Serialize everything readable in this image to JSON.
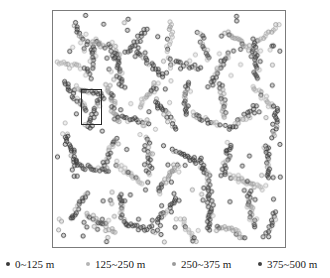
{
  "figure": {
    "type": "scatter-map",
    "background_color": "#ffffff",
    "frame": {
      "border_color": "#7b7b7b",
      "x": 52,
      "y": 10,
      "width": 234,
      "height": 238
    },
    "highlight_rect": {
      "name": "inset-selection-box",
      "border_color": "#2a2a2a",
      "x": 28,
      "y": 78,
      "width": 21,
      "height": 36
    }
  },
  "legend": {
    "items": [
      {
        "label": "0~125 m",
        "color": "#3a3a3a",
        "x": 6
      },
      {
        "label": "125~250 m",
        "color": "#b4b4b4",
        "x": 86
      },
      {
        "label": "250~375 m",
        "color": "#9a9a9a",
        "x": 172
      },
      {
        "label": "375~500 m",
        "color": "#404040",
        "x": 258
      }
    ]
  },
  "chart_data": {
    "type": "scatter",
    "title": "",
    "xlabel": "",
    "ylabel": "",
    "grid": false,
    "axis_ticks": false,
    "legend_position": "bottom",
    "xlim": [
      0,
      234
    ],
    "ylim": [
      0,
      238
    ],
    "categories": [
      "0~125 m",
      "125~250 m",
      "250~375 m",
      "375~500 m"
    ],
    "category_colors": [
      "#3a3a3a",
      "#b4b4b4",
      "#9a9a9a",
      "#404040"
    ],
    "marker_radius": 2.1,
    "marker_style": "open-circle",
    "clusters": [
      {
        "cx": 28,
        "cy": 28,
        "angle": 62,
        "len": 34,
        "spread": 4.0,
        "n": 16,
        "cat": 0
      },
      {
        "cx": 16,
        "cy": 54,
        "angle": 8,
        "len": 24,
        "spread": 3.2,
        "n": 12,
        "cat": 1
      },
      {
        "cx": 40,
        "cy": 48,
        "angle": 104,
        "len": 40,
        "spread": 3.6,
        "n": 20,
        "cat": 0
      },
      {
        "cx": 54,
        "cy": 36,
        "angle": 22,
        "len": 30,
        "spread": 3.0,
        "n": 14,
        "cat": 2
      },
      {
        "cx": 66,
        "cy": 60,
        "angle": 78,
        "len": 36,
        "spread": 3.4,
        "n": 18,
        "cat": 0
      },
      {
        "cx": 84,
        "cy": 30,
        "angle": 130,
        "len": 32,
        "spread": 3.0,
        "n": 15,
        "cat": 3
      },
      {
        "cx": 98,
        "cy": 52,
        "angle": 44,
        "len": 38,
        "spread": 3.6,
        "n": 19,
        "cat": 0
      },
      {
        "cx": 118,
        "cy": 26,
        "angle": 96,
        "len": 30,
        "spread": 3.2,
        "n": 13,
        "cat": 1
      },
      {
        "cx": 132,
        "cy": 54,
        "angle": 16,
        "len": 34,
        "spread": 3.4,
        "n": 17,
        "cat": 0
      },
      {
        "cx": 152,
        "cy": 34,
        "angle": 70,
        "len": 28,
        "spread": 3.0,
        "n": 12,
        "cat": 3
      },
      {
        "cx": 168,
        "cy": 58,
        "angle": 118,
        "len": 36,
        "spread": 3.6,
        "n": 18,
        "cat": 0
      },
      {
        "cx": 186,
        "cy": 30,
        "angle": 34,
        "len": 30,
        "spread": 3.2,
        "n": 14,
        "cat": 2
      },
      {
        "cx": 204,
        "cy": 48,
        "angle": 86,
        "len": 40,
        "spread": 3.8,
        "n": 20,
        "cat": 0
      },
      {
        "cx": 218,
        "cy": 22,
        "angle": 142,
        "len": 26,
        "spread": 2.8,
        "n": 11,
        "cat": 1
      },
      {
        "cx": 22,
        "cy": 86,
        "angle": 52,
        "len": 36,
        "spread": 3.6,
        "n": 18,
        "cat": 0
      },
      {
        "cx": 42,
        "cy": 102,
        "angle": 110,
        "len": 32,
        "spread": 3.2,
        "n": 16,
        "cat": 3
      },
      {
        "cx": 36,
        "cy": 82,
        "angle": 20,
        "len": 28,
        "spread": 3.0,
        "n": 13,
        "cat": 0
      },
      {
        "cx": 60,
        "cy": 92,
        "angle": 74,
        "len": 38,
        "spread": 3.6,
        "n": 19,
        "cat": 2
      },
      {
        "cx": 80,
        "cy": 110,
        "angle": 12,
        "len": 34,
        "spread": 3.4,
        "n": 17,
        "cat": 0
      },
      {
        "cx": 96,
        "cy": 84,
        "angle": 128,
        "len": 30,
        "spread": 3.0,
        "n": 14,
        "cat": 1
      },
      {
        "cx": 114,
        "cy": 104,
        "angle": 58,
        "len": 36,
        "spread": 3.6,
        "n": 18,
        "cat": 0
      },
      {
        "cx": 134,
        "cy": 88,
        "angle": 98,
        "len": 32,
        "spread": 3.2,
        "n": 16,
        "cat": 3
      },
      {
        "cx": 154,
        "cy": 110,
        "angle": 26,
        "len": 30,
        "spread": 3.0,
        "n": 14,
        "cat": 0
      },
      {
        "cx": 172,
        "cy": 90,
        "angle": 80,
        "len": 34,
        "spread": 3.4,
        "n": 17,
        "cat": 2
      },
      {
        "cx": 192,
        "cy": 108,
        "angle": 136,
        "len": 36,
        "spread": 3.6,
        "n": 18,
        "cat": 0
      },
      {
        "cx": 212,
        "cy": 86,
        "angle": 46,
        "len": 28,
        "spread": 3.0,
        "n": 13,
        "cat": 1
      },
      {
        "cx": 224,
        "cy": 112,
        "angle": 92,
        "len": 32,
        "spread": 3.2,
        "n": 15,
        "cat": 0
      },
      {
        "cx": 18,
        "cy": 140,
        "angle": 66,
        "len": 32,
        "spread": 3.2,
        "n": 16,
        "cat": 0
      },
      {
        "cx": 38,
        "cy": 158,
        "angle": 14,
        "len": 36,
        "spread": 3.6,
        "n": 18,
        "cat": 3
      },
      {
        "cx": 58,
        "cy": 142,
        "angle": 112,
        "len": 30,
        "spread": 3.0,
        "n": 14,
        "cat": 0
      },
      {
        "cx": 76,
        "cy": 164,
        "angle": 40,
        "len": 34,
        "spread": 3.4,
        "n": 17,
        "cat": 1
      },
      {
        "cx": 96,
        "cy": 146,
        "angle": 84,
        "len": 38,
        "spread": 3.8,
        "n": 19,
        "cat": 0
      },
      {
        "cx": 116,
        "cy": 168,
        "angle": 124,
        "len": 32,
        "spread": 3.2,
        "n": 16,
        "cat": 2
      },
      {
        "cx": 136,
        "cy": 148,
        "angle": 30,
        "len": 36,
        "spread": 3.6,
        "n": 18,
        "cat": 0
      },
      {
        "cx": 156,
        "cy": 170,
        "angle": 72,
        "len": 30,
        "spread": 3.0,
        "n": 14,
        "cat": 3
      },
      {
        "cx": 176,
        "cy": 150,
        "angle": 104,
        "len": 34,
        "spread": 3.4,
        "n": 17,
        "cat": 0
      },
      {
        "cx": 196,
        "cy": 172,
        "angle": 18,
        "len": 38,
        "spread": 3.8,
        "n": 19,
        "cat": 1
      },
      {
        "cx": 216,
        "cy": 152,
        "angle": 88,
        "len": 32,
        "spread": 3.2,
        "n": 16,
        "cat": 0
      },
      {
        "cx": 26,
        "cy": 196,
        "angle": 120,
        "len": 30,
        "spread": 3.0,
        "n": 14,
        "cat": 0
      },
      {
        "cx": 48,
        "cy": 214,
        "angle": 36,
        "len": 34,
        "spread": 3.4,
        "n": 17,
        "cat": 2
      },
      {
        "cx": 70,
        "cy": 200,
        "angle": 82,
        "len": 30,
        "spread": 3.0,
        "n": 14,
        "cat": 0
      },
      {
        "cx": 92,
        "cy": 218,
        "angle": 10,
        "len": 36,
        "spread": 3.6,
        "n": 18,
        "cat": 3
      },
      {
        "cx": 114,
        "cy": 202,
        "angle": 132,
        "len": 32,
        "spread": 3.2,
        "n": 16,
        "cat": 0
      },
      {
        "cx": 136,
        "cy": 220,
        "angle": 56,
        "len": 30,
        "spread": 3.0,
        "n": 14,
        "cat": 1
      },
      {
        "cx": 158,
        "cy": 204,
        "angle": 94,
        "len": 34,
        "spread": 3.4,
        "n": 17,
        "cat": 0
      },
      {
        "cx": 180,
        "cy": 222,
        "angle": 24,
        "len": 30,
        "spread": 3.0,
        "n": 14,
        "cat": 2
      },
      {
        "cx": 200,
        "cy": 200,
        "angle": 76,
        "len": 36,
        "spread": 3.6,
        "n": 18,
        "cat": 0
      },
      {
        "cx": 220,
        "cy": 216,
        "angle": 114,
        "len": 28,
        "spread": 2.8,
        "n": 13,
        "cat": 3
      }
    ],
    "scatter_noise_count": 150
  }
}
